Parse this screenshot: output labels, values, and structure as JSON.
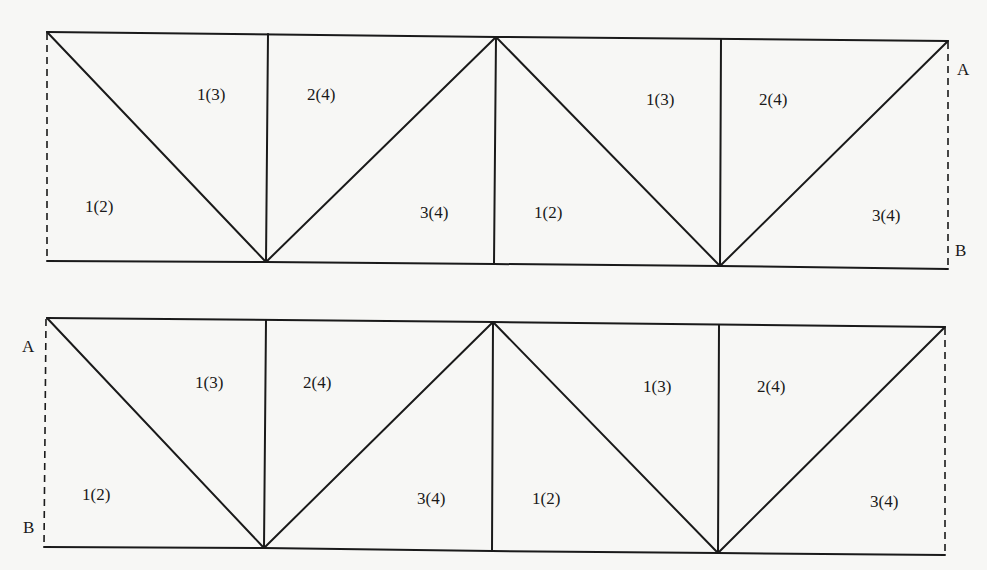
{
  "diagrams": [
    {
      "id": "top",
      "end_labels": {
        "A": "A",
        "B": "B"
      },
      "region_labels": [
        "1(3)",
        "2(4)",
        "1(2)",
        "3(4)",
        "1(2)",
        "1(3)",
        "2(4)",
        "3(4)"
      ]
    },
    {
      "id": "bottom",
      "end_labels": {
        "A": "A",
        "B": "B"
      },
      "region_labels": [
        "1(3)",
        "2(4)",
        "1(2)",
        "3(4)",
        "1(2)",
        "1(3)",
        "2(4)",
        "3(4)"
      ]
    }
  ]
}
